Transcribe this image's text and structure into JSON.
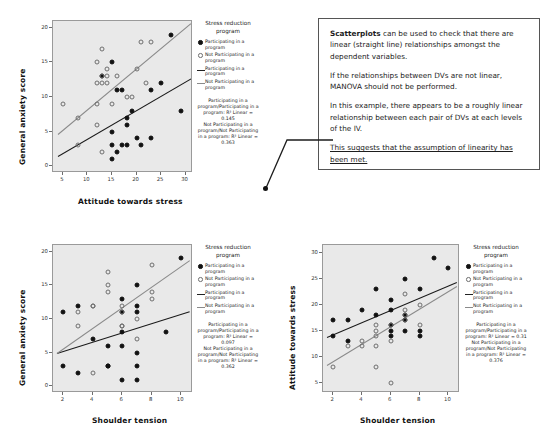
{
  "legend_common": {
    "title": "Stress reduction\nprogram",
    "entries": [
      {
        "key": "filled-dot",
        "label": "Participating in a program"
      },
      {
        "key": "open-dot",
        "label": "Not Participating in a program"
      },
      {
        "key": "dark-line",
        "label": "Participating in a program"
      },
      {
        "key": "light-line",
        "label": "Not Participating in a program"
      }
    ]
  },
  "callout": {
    "paragraphs": [
      {
        "bold_lead": "Scatterplots",
        "text": " can be used to check that there are linear (straight line) relationships amongst the dependent variables.",
        "underline": false
      },
      {
        "bold_lead": "",
        "text": "If the relationships between DVs are not linear, MANOVA should not be performed.",
        "underline": false
      },
      {
        "bold_lead": "",
        "text": "In this example, there appears to be a roughly linear relationship between each pair of DVs at each levels of the IV.",
        "underline": false
      },
      {
        "bold_lead": "",
        "text": "This suggests that the assumption of linearity has been met.",
        "underline": true
      }
    ]
  },
  "chart_data": [
    {
      "id": "chart-anxiety-vs-attitude",
      "type": "scatter",
      "title": "",
      "xlabel": "Attitude towards stress",
      "ylabel": "General anxiety score",
      "xlim": [
        3,
        31.5
      ],
      "ylim": [
        -1,
        21
      ],
      "xticks": [
        5,
        10,
        15,
        20,
        25,
        30
      ],
      "yticks": [
        0,
        5,
        10,
        15,
        20
      ],
      "grid": false,
      "legend_position": "right",
      "legend_fit_text": "Participating in a program/Participating in a program: R² Linear = 0.145\nNot Participating in a program/Not Participating in a program: R² Linear = 0.363",
      "series": [
        {
          "name": "Participating in a program",
          "marker": "filled",
          "r2_linear": 0.145,
          "fit": {
            "x1": 4,
            "y1": 1.4,
            "x2": 31,
            "y2": 12.6
          },
          "points": [
            [
              13,
              13
            ],
            [
              15,
              15
            ],
            [
              16,
              11
            ],
            [
              17,
              11
            ],
            [
              19,
              8
            ],
            [
              18,
              7
            ],
            [
              18,
              6
            ],
            [
              20,
              4
            ],
            [
              23,
              4
            ],
            [
              23,
              11
            ],
            [
              25,
              12
            ],
            [
              27,
              19
            ],
            [
              29,
              8
            ],
            [
              15,
              5
            ],
            [
              15,
              3
            ],
            [
              16,
              2
            ],
            [
              17,
              3
            ],
            [
              18,
              3
            ],
            [
              15,
              1
            ],
            [
              21,
              3
            ]
          ]
        },
        {
          "name": "Not Participating in a program",
          "marker": "open",
          "r2_linear": 0.363,
          "fit": {
            "x1": 4,
            "y1": 4.6,
            "x2": 31,
            "y2": 20.6
          },
          "points": [
            [
              5,
              9
            ],
            [
              8,
              7
            ],
            [
              8,
              3
            ],
            [
              12,
              12
            ],
            [
              12,
              15
            ],
            [
              12,
              9
            ],
            [
              13,
              12
            ],
            [
              13,
              17
            ],
            [
              13,
              13
            ],
            [
              13,
              2
            ],
            [
              14,
              14
            ],
            [
              14,
              12
            ],
            [
              14,
              13
            ],
            [
              15,
              9
            ],
            [
              16,
              13
            ],
            [
              18,
              10
            ],
            [
              19,
              10
            ],
            [
              20,
              14
            ],
            [
              21,
              18
            ],
            [
              22,
              12
            ],
            [
              23,
              18
            ],
            [
              12,
              6
            ]
          ]
        }
      ]
    },
    {
      "id": "chart-anxiety-vs-shoulder",
      "type": "scatter",
      "title": "",
      "xlabel": "Shoulder tension",
      "ylabel": "General anxiety score",
      "xlim": [
        1.3,
        10.8
      ],
      "ylim": [
        -1,
        21
      ],
      "xticks": [
        2,
        4,
        6,
        8,
        10
      ],
      "yticks": [
        0,
        5,
        10,
        15,
        20
      ],
      "grid": false,
      "legend_position": "right",
      "legend_fit_text": "Participating in a program/Participating in a program: R² Linear = 0.097\nNot Participating in a program/Not Participating in a program: R² Linear = 0.362",
      "series": [
        {
          "name": "Participating in a program",
          "marker": "filled",
          "r2_linear": 0.097,
          "fit": {
            "x1": 1.6,
            "y1": 5.0,
            "x2": 10.6,
            "y2": 11.2
          },
          "points": [
            [
              2,
              11
            ],
            [
              3,
              12
            ],
            [
              4,
              7
            ],
            [
              6,
              13
            ],
            [
              6,
              11
            ],
            [
              6,
              8
            ],
            [
              7,
              15
            ],
            [
              7,
              12
            ],
            [
              7,
              11
            ],
            [
              9,
              8
            ],
            [
              10,
              19
            ],
            [
              6,
              6
            ],
            [
              5,
              6
            ],
            [
              5,
              3
            ],
            [
              7,
              5
            ],
            [
              2,
              3
            ],
            [
              3,
              2
            ],
            [
              5,
              3
            ],
            [
              7,
              3
            ],
            [
              6,
              1
            ],
            [
              7,
              1
            ]
          ]
        },
        {
          "name": "Not Participating in a program",
          "marker": "open",
          "r2_linear": 0.362,
          "fit": {
            "x1": 1.6,
            "y1": 4.9,
            "x2": 10.6,
            "y2": 18.7
          },
          "points": [
            [
              3,
              11
            ],
            [
              3,
              9
            ],
            [
              4,
              12
            ],
            [
              4,
              2
            ],
            [
              5,
              17
            ],
            [
              5,
              15
            ],
            [
              5,
              14
            ],
            [
              6,
              12
            ],
            [
              6,
              9
            ],
            [
              6,
              9
            ],
            [
              7,
              10
            ],
            [
              7,
              7
            ],
            [
              8,
              18
            ],
            [
              8,
              14
            ],
            [
              8,
              13
            ],
            [
              6,
              11
            ],
            [
              4,
              12
            ]
          ]
        }
      ]
    },
    {
      "id": "chart-attitude-vs-shoulder",
      "type": "scatter",
      "title": "",
      "xlabel": "Shoulder tension",
      "ylabel": "Attitude towards stress",
      "xlim": [
        1.3,
        10.8
      ],
      "ylim": [
        3,
        31.5
      ],
      "xticks": [
        2,
        4,
        6,
        8,
        10
      ],
      "yticks": [
        5,
        10,
        15,
        20,
        25,
        30
      ],
      "grid": false,
      "legend_position": "right",
      "legend_fit_text": "Participating in a program/Participating in a program: R² Linear = 0.31\nNot Participating in a program/Not Participating in a program: R² Linear = 0.376",
      "series": [
        {
          "name": "Participating in a program",
          "marker": "filled",
          "r2_linear": 0.31,
          "fit": {
            "x1": 1.6,
            "y1": 13.8,
            "x2": 10.6,
            "y2": 24.4
          },
          "points": [
            [
              2,
              17
            ],
            [
              2,
              14
            ],
            [
              3,
              17
            ],
            [
              3,
              13
            ],
            [
              4,
              19
            ],
            [
              5,
              23
            ],
            [
              5,
              18
            ],
            [
              6,
              21
            ],
            [
              6,
              19
            ],
            [
              6,
              16
            ],
            [
              6,
              15
            ],
            [
              7,
              25
            ],
            [
              7,
              18
            ],
            [
              7,
              17
            ],
            [
              7,
              15
            ],
            [
              8,
              23
            ],
            [
              8,
              14
            ],
            [
              8,
              15
            ],
            [
              9,
              29
            ],
            [
              10,
              27
            ],
            [
              6,
              14
            ]
          ]
        },
        {
          "name": "Not Participating in a program",
          "marker": "open",
          "r2_linear": 0.376,
          "fit": {
            "x1": 1.6,
            "y1": 8.4,
            "x2": 10.6,
            "y2": 23.6
          },
          "points": [
            [
              2,
              8
            ],
            [
              3,
              12
            ],
            [
              4,
              13
            ],
            [
              4,
              12
            ],
            [
              5,
              16
            ],
            [
              5,
              15
            ],
            [
              5,
              14
            ],
            [
              5,
              12
            ],
            [
              5,
              8
            ],
            [
              6,
              16
            ],
            [
              6,
              13
            ],
            [
              6,
              5
            ],
            [
              7,
              22
            ],
            [
              7,
              19
            ],
            [
              7,
              17
            ],
            [
              8,
              20
            ],
            [
              8,
              16
            ],
            [
              7,
              18
            ]
          ]
        }
      ]
    }
  ]
}
